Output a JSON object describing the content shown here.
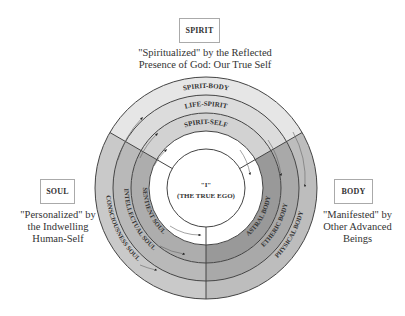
{
  "spirit": {
    "label": "SPIRIT",
    "caption_line1": "\"Spiritualized\" by the Reflected",
    "caption_line2": "Presence of God: Our True Self",
    "rings": [
      "SPIRIT-BODY",
      "LIFE-SPIRIT",
      "SPIRIT-SELF"
    ]
  },
  "soul": {
    "label": "SOUL",
    "caption_line1": "\"Personalized\" by",
    "caption_line2": "the Indwelling",
    "caption_line3": "Human-Self",
    "rings": [
      "CONSCIOUSNESS SOUL",
      "INTELLECTUAL SOUL",
      "SENTIENT SOUL"
    ]
  },
  "body": {
    "label": "BODY",
    "caption_line1": "\"Manifested\" by",
    "caption_line2": "Other Advanced",
    "caption_line3": "Beings",
    "rings": [
      "PHYSICAL BODY",
      "ETHERIC BODY",
      "ASTRAL BODY"
    ]
  },
  "center": {
    "line1": "\"I\"",
    "line2": "(THE TRUE EGO)"
  },
  "colors": {
    "spirit_outer": "#e6e6e6",
    "spirit_mid": "#dcdcdc",
    "spirit_inner": "#d2d2d2",
    "soul_outer": "#c9c9c9",
    "soul_mid": "#b9b9b9",
    "soul_inner": "#adadad",
    "body_outer": "#bdbdbd",
    "body_mid": "#a9a9a9",
    "body_inner": "#999999",
    "line": "#444444"
  }
}
